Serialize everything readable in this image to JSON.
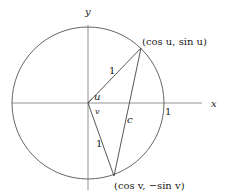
{
  "diagram": {
    "axes": {
      "x_label": "x",
      "y_label": "y"
    },
    "circle": {
      "radius_label": "1"
    },
    "points": {
      "p1_label": "(cos u, sin u)",
      "p2_label": "(cos v, −sin v)"
    },
    "segments": {
      "radius_to_p1_label": "1",
      "radius_to_p2_label": "1",
      "chord_label": "c"
    },
    "angles": {
      "angle_u_label": "u",
      "angle_v_label": "v"
    }
  }
}
